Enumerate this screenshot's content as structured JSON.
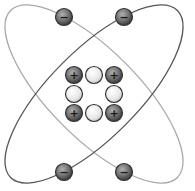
{
  "diagram": {
    "center": [
      94,
      94
    ],
    "orbits": [
      {
        "name": "orbit-light",
        "rotation": 45,
        "rx": 118,
        "ry": 44,
        "color": "#a8a8a8"
      },
      {
        "name": "orbit-dark",
        "rotation": -45,
        "rx": 118,
        "ry": 44,
        "color": "#555555"
      }
    ],
    "electrons": [
      {
        "x": 64,
        "y": 17,
        "symbol": "−"
      },
      {
        "x": 124,
        "y": 17,
        "symbol": "−"
      },
      {
        "x": 64,
        "y": 172,
        "symbol": "−"
      },
      {
        "x": 124,
        "y": 172,
        "symbol": "−"
      }
    ],
    "nucleus": [
      {
        "x": 74,
        "y": 75,
        "type": "proton",
        "symbol": "+"
      },
      {
        "x": 94,
        "y": 75,
        "type": "neutron",
        "symbol": ""
      },
      {
        "x": 114,
        "y": 75,
        "type": "proton",
        "symbol": "+"
      },
      {
        "x": 74,
        "y": 94,
        "type": "neutron",
        "symbol": ""
      },
      {
        "x": 114,
        "y": 94,
        "type": "neutron",
        "symbol": ""
      },
      {
        "x": 74,
        "y": 113,
        "type": "proton",
        "symbol": "+"
      },
      {
        "x": 94,
        "y": 113,
        "type": "neutron",
        "symbol": ""
      },
      {
        "x": 114,
        "y": 113,
        "type": "proton",
        "symbol": "+"
      }
    ],
    "colors": {
      "proton_fill": "#6e6e6e",
      "neutron_fill": "#e6e6e6",
      "electron_fill": "#6e6e6e",
      "stroke": "#333333"
    }
  }
}
